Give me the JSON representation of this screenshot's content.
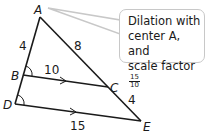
{
  "diagram": {
    "vertices": {
      "A": {
        "label": "A",
        "x": 40,
        "y": 17
      },
      "B": {
        "label": "B",
        "x": 23,
        "y": 75
      },
      "C": {
        "label": "C",
        "x": 108,
        "y": 87
      },
      "D": {
        "label": "D",
        "x": 15,
        "y": 104
      },
      "E": {
        "label": "E",
        "x": 141,
        "y": 121
      }
    },
    "segment_labels": {
      "AB": "4",
      "AC": "8",
      "BC": "10",
      "CE": "4",
      "DE": "15"
    },
    "callout": {
      "line1": "Dilation with",
      "line2": "center A, and",
      "line3": "scale factor",
      "fraction_numerator": "15",
      "fraction_denominator": "10"
    },
    "colors": {
      "stroke": "#1a1a1a",
      "callout_border": "#c8c8c8"
    }
  }
}
